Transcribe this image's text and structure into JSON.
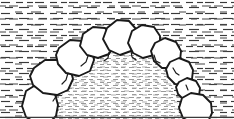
{
  "figure": {
    "title": "Stone arch cross-section line drawing",
    "type": "line-art illustration",
    "width": 234,
    "height": 119,
    "background_color": "#ffffff",
    "ink_color": "#1a1a1a",
    "hatch_color": "#3a3a3a",
    "fill_color": "#ffffff",
    "stipple_color": "#8a8a8a",
    "border": {
      "bottom_rule": true,
      "top_rule": false,
      "left_rule": false,
      "right_rule": false,
      "color": "#3a3a3a"
    },
    "regions": [
      {
        "name": "surrounding-earth-hatching",
        "label": "Surrounding earth / fill matrix",
        "texture": "short horizontal dashes",
        "density": "medium"
      },
      {
        "name": "arch-interior-stipple",
        "label": "Arch void / interior fill",
        "texture": "fine short horizontal dashes",
        "density": "high"
      }
    ],
    "stones": [
      {
        "id": "stone-01",
        "label": "Left springer (lower)",
        "cx": 39,
        "cy": 106,
        "rx": 20,
        "ry": 18,
        "rot": -8
      },
      {
        "id": "stone-02",
        "label": "Left springer (upper)",
        "cx": 51,
        "cy": 78,
        "rx": 22,
        "ry": 20,
        "rot": 5
      },
      {
        "id": "stone-03",
        "label": "Left voussoir 1",
        "cx": 74,
        "cy": 57,
        "rx": 20,
        "ry": 20,
        "rot": -12
      },
      {
        "id": "stone-04",
        "label": "Left voussoir 2",
        "cx": 95,
        "cy": 42,
        "rx": 18,
        "ry": 17,
        "rot": 10
      },
      {
        "id": "stone-05",
        "label": "Keystone",
        "cx": 118,
        "cy": 37,
        "rx": 18,
        "ry": 19,
        "rot": -4
      },
      {
        "id": "stone-06",
        "label": "Right voussoir 1",
        "cx": 142,
        "cy": 40,
        "rx": 18,
        "ry": 18,
        "rot": 7
      },
      {
        "id": "stone-07",
        "label": "Right voussoir 2",
        "cx": 164,
        "cy": 52,
        "rx": 18,
        "ry": 17,
        "rot": -6
      },
      {
        "id": "stone-08",
        "label": "Right voussoir 3",
        "cx": 180,
        "cy": 70,
        "rx": 15,
        "ry": 15,
        "rot": 9
      },
      {
        "id": "stone-09",
        "label": "Right voussoir 4",
        "cx": 189,
        "cy": 89,
        "rx": 13,
        "ry": 13,
        "rot": -5
      },
      {
        "id": "stone-10",
        "label": "Right springer",
        "cx": 196,
        "cy": 108,
        "rx": 16,
        "ry": 15,
        "rot": 6
      }
    ],
    "stone_count": 10,
    "annotations": []
  }
}
